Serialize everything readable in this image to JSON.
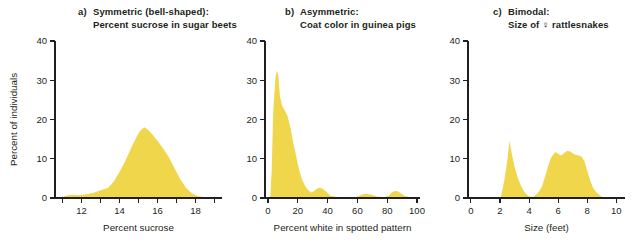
{
  "figure": {
    "y_axis_label": "Percent of individuals",
    "fill_color": "#F0D64B",
    "axis_color": "#231f20"
  },
  "panels": [
    {
      "letter": "a)",
      "title_line1": "Symmetric (bell-shaped):",
      "title_line2": "Percent sucrose in sugar beets",
      "xlabel": "Percent sucrose"
    },
    {
      "letter": "b)",
      "title_line1": "Asymmetric:",
      "title_line2": "Coat color in guinea pigs",
      "xlabel": "Percent white in spotted pattern"
    },
    {
      "letter": "c)",
      "title_line1": "Bimodal:",
      "title_line2": "Size of ♀ rattlesnakes",
      "xlabel": "Size (feet)"
    }
  ],
  "chart_data": [
    {
      "type": "area",
      "title": "Symmetric (bell-shaped): Percent sucrose in sugar beets",
      "xlabel": "Percent sucrose",
      "ylabel": "Percent of individuals",
      "xlim": [
        10.6,
        19.4
      ],
      "ylim": [
        0,
        40
      ],
      "xticks": [
        11,
        12,
        13,
        14,
        15,
        16,
        17,
        18,
        19
      ],
      "xticklabels": [
        "",
        "12",
        "",
        "14",
        "",
        "16",
        "",
        "18",
        ""
      ],
      "yticks": [
        0,
        10,
        20,
        30,
        40
      ],
      "yticklabels": [
        "0",
        "10",
        "20",
        "30",
        "40"
      ],
      "grid": false,
      "x": [
        10.6,
        11.0,
        11.3,
        11.6,
        11.9,
        12.1,
        12.3,
        12.6,
        12.9,
        13.1,
        13.4,
        13.7,
        14.0,
        14.3,
        14.6,
        14.9,
        15.1,
        15.3,
        15.5,
        15.7,
        16.0,
        16.3,
        16.6,
        16.9,
        17.2,
        17.5,
        17.8,
        18.1,
        18.5,
        19.0,
        19.4
      ],
      "y": [
        0.0,
        0.3,
        0.7,
        0.8,
        0.7,
        0.8,
        1.0,
        1.3,
        1.8,
        2.1,
        2.6,
        4.2,
        6.6,
        9.4,
        12.6,
        15.6,
        17.2,
        18.0,
        17.4,
        16.4,
        14.6,
        12.6,
        10.4,
        7.6,
        4.8,
        2.6,
        1.2,
        0.5,
        0.2,
        0.0,
        0.0
      ]
    },
    {
      "type": "area",
      "title": "Asymmetric: Coat color in guinea pigs",
      "xlabel": "Percent white in spotted pattern",
      "ylabel": "Percent of individuals",
      "xlim": [
        -2,
        102
      ],
      "ylim": [
        0,
        40
      ],
      "xticks": [
        0,
        20,
        40,
        60,
        80,
        100
      ],
      "xticklabels": [
        "0",
        "20",
        "40",
        "60",
        "80",
        "100"
      ],
      "yticks": [
        0,
        10,
        20,
        30,
        40
      ],
      "yticklabels": [
        "0",
        "10",
        "20",
        "30",
        "40"
      ],
      "grid": false,
      "x": [
        1.5,
        2.5,
        3.5,
        5.0,
        6.0,
        7.0,
        8.0,
        9.5,
        11.0,
        13.0,
        15.0,
        17.0,
        19.0,
        21.0,
        23.0,
        25.0,
        27.0,
        29.0,
        31.0,
        33.0,
        35.0,
        37.0,
        39.0,
        42.0,
        48.0,
        55.0,
        60.0,
        63.0,
        66.0,
        69.0,
        73.0,
        78.0,
        81.0,
        83.0,
        85.0,
        87.0,
        89.0,
        92.0,
        96.0,
        100.0
      ],
      "y": [
        0.0,
        7.0,
        22.0,
        30.5,
        32.5,
        31.0,
        26.0,
        23.5,
        22.5,
        21.0,
        18.0,
        14.0,
        10.5,
        7.0,
        4.6,
        3.0,
        2.0,
        1.4,
        1.8,
        2.4,
        2.6,
        2.3,
        1.6,
        0.6,
        0.1,
        0.1,
        0.3,
        0.9,
        1.1,
        0.9,
        0.4,
        0.2,
        0.6,
        1.4,
        1.8,
        1.7,
        1.2,
        0.5,
        0.1,
        0.0
      ]
    },
    {
      "type": "area",
      "title": "Bimodal: Size of ♀ rattlesnakes",
      "xlabel": "Size (feet)",
      "ylabel": "Percent of individuals",
      "xlim": [
        -0.2,
        10.6
      ],
      "ylim": [
        0,
        40
      ],
      "xticks": [
        0,
        2,
        4,
        6,
        8,
        10
      ],
      "xticklabels": [
        "0",
        "2",
        "4",
        "6",
        "8",
        "10"
      ],
      "yticks": [
        0,
        10,
        20,
        30,
        40
      ],
      "yticklabels": [
        "0",
        "10",
        "20",
        "30",
        "40"
      ],
      "grid": false,
      "x": [
        2.05,
        2.3,
        2.5,
        2.65,
        2.8,
        3.0,
        3.2,
        3.4,
        3.6,
        3.8,
        4.0,
        4.3,
        4.6,
        4.9,
        5.1,
        5.3,
        5.5,
        5.8,
        6.0,
        6.2,
        6.4,
        6.6,
        6.8,
        7.0,
        7.2,
        7.4,
        7.6,
        7.8,
        8.0,
        8.2,
        8.4,
        8.6,
        8.8,
        9.0,
        9.2
      ],
      "y": [
        0.0,
        4.5,
        9.5,
        14.5,
        11.5,
        8.0,
        5.5,
        3.5,
        2.0,
        1.0,
        0.4,
        0.3,
        1.2,
        3.0,
        5.5,
        8.0,
        10.2,
        11.7,
        11.3,
        10.8,
        11.4,
        12.0,
        11.9,
        11.4,
        11.0,
        10.8,
        10.6,
        9.5,
        7.0,
        4.5,
        2.6,
        1.6,
        0.9,
        0.3,
        0.0
      ]
    }
  ]
}
